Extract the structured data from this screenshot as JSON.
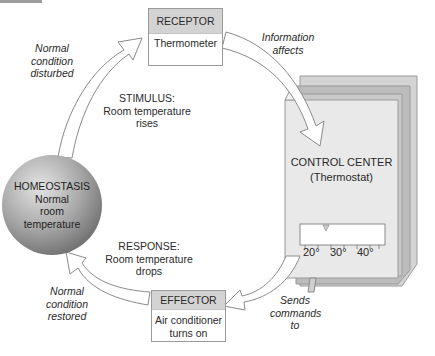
{
  "diagram": {
    "nodes": {
      "homeostasis": {
        "title": "HOMEOSTASIS",
        "lines": [
          "Normal",
          "room",
          "temperature"
        ]
      },
      "receptor": {
        "title": "RECEPTOR",
        "body": "Thermometer"
      },
      "control_center": {
        "title": "CONTROL CENTER",
        "subtitle": "(Thermostat)",
        "scale_labels": [
          "20°",
          "30°",
          "40°"
        ]
      },
      "effector": {
        "title": "EFFECTOR",
        "lines": [
          "Air conditioner",
          "turns on"
        ]
      }
    },
    "edges": [
      {
        "from": "homeostasis",
        "to": "receptor",
        "label_lines": [
          "Normal",
          "condition",
          "disturbed"
        ]
      },
      {
        "from": "receptor",
        "to": "control_center",
        "label_lines": [
          "Information",
          "affects"
        ]
      },
      {
        "from": "control_center",
        "to": "effector",
        "label_lines": [
          "Sends",
          "commands",
          "to"
        ]
      },
      {
        "from": "effector",
        "to": "homeostasis",
        "label_lines": [
          "Normal",
          "condition",
          "restored"
        ]
      }
    ],
    "annotations": {
      "stimulus": [
        "STIMULUS:",
        "Room temperature",
        "rises"
      ],
      "response": [
        "RESPONSE:",
        "Room temperature",
        "drops"
      ]
    },
    "colors": {
      "sphere_light": "#dcdcdc",
      "sphere_dark": "#6e6e6e",
      "box_header": "#d3d3d3",
      "panel_front": "#e8e8e8",
      "panel_mid": "#c8c8c8",
      "panel_back": "#b8b8b8",
      "arrow_fill": "#ffffff",
      "arrow_stroke": "#8a8a8a"
    }
  }
}
